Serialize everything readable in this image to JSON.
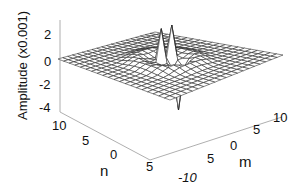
{
  "chart_data": {
    "type": "surface3d",
    "title": "",
    "xlabel": "m",
    "ylabel": "n",
    "zlabel": "Amplitude (x0.001)",
    "x_ticks": [
      "-10",
      "5",
      "0",
      "5",
      "10"
    ],
    "y_ticks": [
      "10",
      "5",
      "0",
      "5"
    ],
    "z_ticks": [
      "2",
      "0",
      "-2",
      "-4"
    ],
    "xlim": [
      -10,
      10
    ],
    "ylim": [
      -10,
      10
    ],
    "zlim": [
      -4,
      3
    ],
    "grid_size": 21,
    "features": [
      {
        "kind": "peak",
        "m": -1,
        "n": 0,
        "value": 3.0
      },
      {
        "kind": "peak",
        "m": 1,
        "n": 0,
        "value": 3.0
      },
      {
        "kind": "trough",
        "m": 0,
        "n": -2,
        "value": -4.0
      },
      {
        "kind": "ring",
        "radius": 4,
        "value": 0.4
      }
    ],
    "colors": {
      "mesh": "#222222",
      "face": "#ffffff",
      "axes": "#999999"
    }
  }
}
